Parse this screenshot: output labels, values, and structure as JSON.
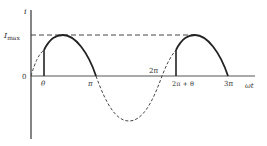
{
  "diagram": {
    "type": "waveform",
    "y_axis_label": "i",
    "x_axis_label": "ωt",
    "origin_label": "0",
    "imax_label_main": "I",
    "imax_label_sub": "max",
    "tick_labels": {
      "theta": "θ",
      "pi": "π",
      "two_pi": "2π",
      "two_pi_plus_theta": "2π + θ",
      "three_pi": "3π"
    },
    "colors": {
      "curve": "#222222",
      "axis": "#333333",
      "dashed": "#444444"
    }
  }
}
